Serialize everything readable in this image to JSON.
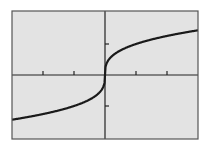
{
  "chart_data": {
    "type": "line",
    "title": "",
    "xlabel": "",
    "ylabel": "",
    "function": "y = x^(1/3)",
    "xlim": [
      -3,
      3
    ],
    "ylim": [
      -2.06,
      2.06
    ],
    "x_ticks": [
      -2,
      -1,
      1,
      2
    ],
    "y_ticks": [
      -1,
      1
    ],
    "grid": false,
    "legend": null,
    "series": [
      {
        "name": "cube root",
        "x": [
          -3,
          -2.5,
          -2,
          -1.5,
          -1,
          -0.5,
          -0.1,
          0,
          0.1,
          0.5,
          1,
          1.5,
          2,
          2.5,
          3
        ],
        "y": [
          -1.442,
          -1.357,
          -1.26,
          -1.145,
          -1,
          -0.794,
          -0.464,
          0,
          0.464,
          0.794,
          1,
          1.145,
          1.26,
          1.357,
          1.442
        ]
      }
    ]
  },
  "colors": {
    "page_background": "#ffffff",
    "plot_background": "#e3e3e3",
    "frame": "#555555",
    "axis": "#222222",
    "curve": "#1a1a1a"
  },
  "layout": {
    "frame": {
      "left": 12,
      "top": 11,
      "right": 198,
      "bottom": 139
    },
    "origin": {
      "x": 105,
      "y": 75
    },
    "unit_px": 31
  }
}
